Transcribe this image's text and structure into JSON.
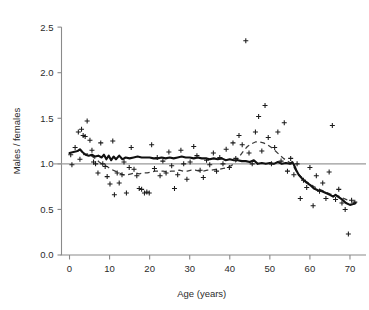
{
  "chart_data": {
    "type": "scatter",
    "title": "",
    "xlabel": "Age (years)",
    "ylabel": "Males / females",
    "xlim": [
      -2,
      74
    ],
    "ylim": [
      0.0,
      2.6
    ],
    "xticks": [
      0,
      10,
      20,
      30,
      40,
      50,
      60,
      70
    ],
    "xtick_labels": [
      "0",
      "10",
      "20",
      "30",
      "40",
      "50",
      "60",
      "70"
    ],
    "yticks": [
      0.0,
      0.5,
      1.0,
      1.5,
      2.0,
      2.5
    ],
    "ytick_labels": [
      "0.0",
      "0.5",
      "1.0",
      "1.5",
      "2.0",
      "2.5"
    ],
    "grid": false,
    "legend": null,
    "reference_line": {
      "name": "parity-line",
      "orientation": "horizontal",
      "y": 1.0,
      "color": "#9a9a9a"
    },
    "series": [
      {
        "name": "Observed ratio by age",
        "type": "scatter",
        "marker": "plus",
        "color": "#1a1a1a",
        "points": [
          [
            0.3,
            1.1
          ],
          [
            0.6,
            0.99
          ],
          [
            1.4,
            1.18
          ],
          [
            2.2,
            1.35
          ],
          [
            2.6,
            1.05
          ],
          [
            3.0,
            1.38
          ],
          [
            3.4,
            1.31
          ],
          [
            3.9,
            1.3
          ],
          [
            4.4,
            1.47
          ],
          [
            5.1,
            1.26
          ],
          [
            5.6,
            1.15
          ],
          [
            6.0,
            1.02
          ],
          [
            6.5,
            1.0
          ],
          [
            7.1,
            0.9
          ],
          [
            7.8,
            1.23
          ],
          [
            8.3,
            1.0
          ],
          [
            8.9,
            0.97
          ],
          [
            9.4,
            0.86
          ],
          [
            10.1,
            0.78
          ],
          [
            10.8,
            1.25
          ],
          [
            11.2,
            0.66
          ],
          [
            11.9,
            0.9
          ],
          [
            12.4,
            0.79
          ],
          [
            13.1,
            0.88
          ],
          [
            13.6,
            1.02
          ],
          [
            14.2,
            0.68
          ],
          [
            14.9,
            0.96
          ],
          [
            15.4,
            1.18
          ],
          [
            16.1,
            0.94
          ],
          [
            16.8,
            0.87
          ],
          [
            17.4,
            0.73
          ],
          [
            18.0,
            0.72
          ],
          [
            18.7,
            0.68
          ],
          [
            19.3,
            0.69
          ],
          [
            19.9,
            0.68
          ],
          [
            20.5,
            1.21
          ],
          [
            21.2,
            0.95
          ],
          [
            21.9,
            1.07
          ],
          [
            22.6,
            0.87
          ],
          [
            23.3,
            1.03
          ],
          [
            24.1,
            0.9
          ],
          [
            24.8,
            1.13
          ],
          [
            25.5,
            0.98
          ],
          [
            26.2,
            0.73
          ],
          [
            27.0,
            0.88
          ],
          [
            27.8,
            1.15
          ],
          [
            28.5,
            1.0
          ],
          [
            29.3,
            0.83
          ],
          [
            30.1,
            1.02
          ],
          [
            31.0,
            1.19
          ],
          [
            31.8,
            1.09
          ],
          [
            32.6,
            0.93
          ],
          [
            33.4,
            0.85
          ],
          [
            34.2,
            1.04
          ],
          [
            35.0,
            0.99
          ],
          [
            35.9,
            1.12
          ],
          [
            36.7,
            0.92
          ],
          [
            37.5,
            1.07
          ],
          [
            38.3,
            1.0
          ],
          [
            39.1,
            1.16
          ],
          [
            39.9,
            0.96
          ],
          [
            40.8,
            1.23
          ],
          [
            41.5,
            1.06
          ],
          [
            42.3,
            1.31
          ],
          [
            43.1,
            1.21
          ],
          [
            44.0,
            2.35
          ],
          [
            44.8,
            1.12
          ],
          [
            45.6,
            1.0
          ],
          [
            46.4,
            1.35
          ],
          [
            47.2,
            1.52
          ],
          [
            48.0,
            1.14
          ],
          [
            48.8,
            1.64
          ],
          [
            49.6,
            1.29
          ],
          [
            50.4,
            1.0
          ],
          [
            51.2,
            1.18
          ],
          [
            52.0,
            1.35
          ],
          [
            52.8,
            1.03
          ],
          [
            53.6,
            1.45
          ],
          [
            54.4,
            0.92
          ],
          [
            55.2,
            1.06
          ],
          [
            56.0,
            0.88
          ],
          [
            56.8,
            1.0
          ],
          [
            57.6,
            0.62
          ],
          [
            58.4,
            0.82
          ],
          [
            59.2,
            0.74
          ],
          [
            60.0,
            0.96
          ],
          [
            60.8,
            0.54
          ],
          [
            61.6,
            0.87
          ],
          [
            62.4,
            0.7
          ],
          [
            63.2,
            0.79
          ],
          [
            64.0,
            0.62
          ],
          [
            64.8,
            0.91
          ],
          [
            65.6,
            1.42
          ],
          [
            66.4,
            0.61
          ],
          [
            67.2,
            0.72
          ],
          [
            68.0,
            0.57
          ],
          [
            68.8,
            0.5
          ],
          [
            69.6,
            0.23
          ],
          [
            70.4,
            0.6
          ],
          [
            71.2,
            0.58
          ]
        ]
      },
      {
        "name": "Running mean (solid)",
        "type": "line",
        "style": "solid",
        "color": "#111111",
        "points": [
          [
            0.0,
            1.12
          ],
          [
            1.0,
            1.13
          ],
          [
            2.0,
            1.14
          ],
          [
            2.6,
            1.16
          ],
          [
            3.2,
            1.13
          ],
          [
            4.0,
            1.1
          ],
          [
            4.8,
            1.09
          ],
          [
            5.6,
            1.1
          ],
          [
            6.4,
            1.08
          ],
          [
            7.2,
            1.09
          ],
          [
            8.0,
            1.07
          ],
          [
            8.6,
            1.1
          ],
          [
            9.2,
            1.05
          ],
          [
            9.8,
            1.09
          ],
          [
            10.4,
            1.04
          ],
          [
            11.0,
            1.08
          ],
          [
            11.6,
            1.05
          ],
          [
            12.4,
            1.09
          ],
          [
            13.2,
            1.05
          ],
          [
            14.0,
            1.07
          ],
          [
            15.0,
            1.06
          ],
          [
            16.0,
            1.07
          ],
          [
            17.0,
            1.08
          ],
          [
            18.0,
            1.07
          ],
          [
            19.0,
            1.07
          ],
          [
            20.0,
            1.07
          ],
          [
            21.0,
            1.06
          ],
          [
            22.0,
            1.06
          ],
          [
            23.0,
            1.07
          ],
          [
            24.0,
            1.06
          ],
          [
            25.0,
            1.07
          ],
          [
            26.0,
            1.06
          ],
          [
            27.0,
            1.07
          ],
          [
            28.0,
            1.08
          ],
          [
            29.0,
            1.07
          ],
          [
            30.0,
            1.07
          ],
          [
            31.0,
            1.06
          ],
          [
            32.0,
            1.07
          ],
          [
            33.0,
            1.06
          ],
          [
            34.0,
            1.06
          ],
          [
            35.0,
            1.05
          ],
          [
            36.0,
            1.06
          ],
          [
            37.0,
            1.05
          ],
          [
            38.0,
            1.06
          ],
          [
            39.0,
            1.04
          ],
          [
            40.0,
            1.05
          ],
          [
            41.0,
            1.04
          ],
          [
            42.0,
            1.04
          ],
          [
            43.0,
            1.03
          ],
          [
            44.0,
            1.03
          ],
          [
            45.0,
            1.02
          ],
          [
            46.0,
            1.04
          ],
          [
            47.0,
            1.0
          ],
          [
            48.0,
            1.01
          ],
          [
            49.0,
            1.0
          ],
          [
            50.0,
            1.01
          ],
          [
            51.0,
            1.0
          ],
          [
            52.0,
            1.02
          ],
          [
            53.0,
            1.0
          ],
          [
            54.0,
            1.01
          ],
          [
            55.0,
            1.0
          ],
          [
            55.6,
            1.02
          ],
          [
            56.0,
            0.99
          ],
          [
            56.6,
            0.93
          ],
          [
            57.2,
            0.88
          ],
          [
            58.0,
            0.84
          ],
          [
            59.0,
            0.8
          ],
          [
            60.0,
            0.77
          ],
          [
            61.0,
            0.73
          ],
          [
            62.0,
            0.71
          ],
          [
            63.0,
            0.7
          ],
          [
            64.0,
            0.68
          ],
          [
            65.0,
            0.66
          ],
          [
            65.8,
            0.64
          ],
          [
            66.4,
            0.66
          ],
          [
            67.0,
            0.64
          ],
          [
            68.0,
            0.61
          ],
          [
            69.0,
            0.57
          ],
          [
            70.0,
            0.55
          ],
          [
            70.8,
            0.56
          ],
          [
            71.4,
            0.57
          ]
        ]
      },
      {
        "name": "Running mean (dashed)",
        "type": "line",
        "style": "dashed",
        "color": "#3a3a3a",
        "points": [
          [
            3.4,
            1.1
          ],
          [
            4.4,
            1.11
          ],
          [
            5.4,
            1.09
          ],
          [
            6.4,
            1.06
          ],
          [
            7.4,
            1.02
          ],
          [
            8.4,
            0.99
          ],
          [
            9.4,
            0.97
          ],
          [
            10.4,
            0.94
          ],
          [
            11.4,
            0.92
          ],
          [
            12.4,
            0.9
          ],
          [
            13.4,
            0.88
          ],
          [
            14.4,
            0.88
          ],
          [
            15.4,
            0.89
          ],
          [
            16.4,
            0.9
          ],
          [
            17.4,
            0.89
          ],
          [
            18.4,
            0.9
          ],
          [
            19.4,
            0.9
          ],
          [
            20.4,
            0.91
          ],
          [
            21.4,
            0.92
          ],
          [
            22.4,
            0.92
          ],
          [
            23.4,
            0.92
          ],
          [
            24.4,
            0.91
          ],
          [
            25.4,
            0.92
          ],
          [
            26.4,
            0.92
          ],
          [
            27.4,
            0.93
          ],
          [
            28.4,
            0.92
          ],
          [
            29.4,
            0.92
          ],
          [
            30.4,
            0.93
          ],
          [
            31.4,
            0.93
          ],
          [
            32.4,
            0.92
          ],
          [
            33.4,
            0.92
          ],
          [
            34.4,
            0.93
          ],
          [
            35.4,
            0.93
          ],
          [
            36.4,
            0.94
          ],
          [
            37.4,
            0.94
          ],
          [
            38.4,
            0.95
          ],
          [
            39.4,
            0.96
          ],
          [
            40.4,
            0.98
          ],
          [
            41.4,
            1.02
          ],
          [
            42.4,
            1.08
          ],
          [
            43.4,
            1.14
          ],
          [
            44.4,
            1.19
          ],
          [
            45.4,
            1.22
          ],
          [
            46.4,
            1.24
          ],
          [
            47.4,
            1.24
          ],
          [
            48.4,
            1.23
          ],
          [
            49.4,
            1.21
          ],
          [
            50.4,
            1.18
          ],
          [
            51.4,
            1.14
          ],
          [
            52.4,
            1.1
          ],
          [
            53.4,
            1.06
          ],
          [
            54.4,
            1.03
          ],
          [
            55.4,
            1.0
          ],
          [
            56.2,
            0.95
          ],
          [
            57.0,
            0.89
          ],
          [
            58.0,
            0.85
          ],
          [
            59.0,
            0.81
          ],
          [
            60.0,
            0.78
          ],
          [
            61.0,
            0.75
          ],
          [
            62.0,
            0.73
          ],
          [
            63.0,
            0.71
          ],
          [
            64.0,
            0.69
          ],
          [
            65.0,
            0.67
          ],
          [
            66.0,
            0.66
          ],
          [
            67.0,
            0.65
          ],
          [
            68.0,
            0.63
          ],
          [
            69.0,
            0.61
          ],
          [
            70.0,
            0.59
          ]
        ]
      }
    ]
  }
}
